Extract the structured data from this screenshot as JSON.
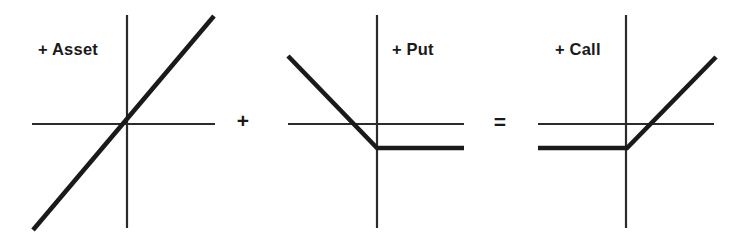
{
  "figure": {
    "background_color": "#ffffff",
    "line_color": "#1a1a1a",
    "axis_color": "#2b2b2b"
  },
  "panels": [
    {
      "id": "asset",
      "label": "+ Asset",
      "label_x": 38,
      "label_y": 55,
      "axis": {
        "x_axis": {
          "x1": 32,
          "y1": 124,
          "x2": 215,
          "y2": 124
        },
        "y_axis": {
          "x1": 127,
          "y1": 15,
          "x2": 127,
          "y2": 228
        }
      },
      "payoff_points": "33,230 214,16",
      "description": "Long asset: straight 45-degree line through the origin"
    },
    {
      "id": "put",
      "label": "+ Put",
      "label_x": 392,
      "label_y": 55,
      "axis": {
        "x_axis": {
          "x1": 288,
          "y1": 124,
          "x2": 464,
          "y2": 124
        },
        "y_axis": {
          "x1": 377,
          "y1": 15,
          "x2": 377,
          "y2": 228
        }
      },
      "payoff_points": "288,56 377,148 464,148",
      "description": "Long put: downward slope to the left of the strike, flat below the x-axis to the right"
    },
    {
      "id": "call",
      "label": "+ Call",
      "label_x": 555,
      "label_y": 55,
      "axis": {
        "x_axis": {
          "x1": 538,
          "y1": 124,
          "x2": 714,
          "y2": 124
        },
        "y_axis": {
          "x1": 626,
          "y1": 15,
          "x2": 626,
          "y2": 228
        }
      },
      "payoff_points": "538,148 627,148 716,57",
      "description": "Long call: flat below the x-axis to the left of the strike, upward slope to the right"
    }
  ],
  "operators": [
    {
      "id": "plus",
      "symbol": "+",
      "x": 243,
      "y": 122
    },
    {
      "id": "equals",
      "symbol": "=",
      "x": 500,
      "y": 123
    }
  ],
  "chart_data": {
    "type": "line",
    "xlabel": "",
    "ylabel": "",
    "grid": false,
    "legend": "none",
    "annotations": [
      "+ Asset",
      "+",
      "+ Put",
      "=",
      "+ Call"
    ],
    "equation": "+ Asset + Put = + Call",
    "series": [
      {
        "name": "+ Asset",
        "panel": "asset",
        "shape": "linear",
        "x": [
          -1.0,
          1.0
        ],
        "y": [
          -1.0,
          1.0
        ],
        "kink_x": 0.0,
        "slope_left": 1.0,
        "slope_right": 1.0
      },
      {
        "name": "+ Put",
        "panel": "put",
        "shape": "piecewise-linear",
        "x": [
          -1.0,
          0.0,
          1.0
        ],
        "y": [
          0.78,
          -0.28,
          -0.28
        ],
        "kink_x": 0.0,
        "slope_left": -1.06,
        "slope_right": 0.0
      },
      {
        "name": "+ Call",
        "panel": "call",
        "shape": "piecewise-linear",
        "x": [
          -1.0,
          0.0,
          1.0
        ],
        "y": [
          -0.28,
          -0.28,
          0.78
        ],
        "kink_x": 0.0,
        "slope_left": 0.0,
        "slope_right": 1.06
      }
    ]
  }
}
